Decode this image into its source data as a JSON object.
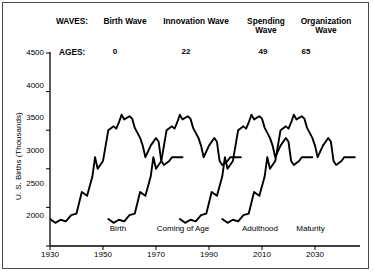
{
  "chart_data": {
    "type": "line",
    "title": "",
    "xlabel": "",
    "ylabel": "U. S. Births (Thousands)",
    "xlim": [
      1930,
      2042
    ],
    "ylim": [
      2000,
      4500
    ],
    "grid": false,
    "legend_position": "none",
    "ytick_labels": [
      "4500",
      "4000",
      "3500",
      "3000",
      "2500",
      "2000"
    ],
    "ytick_values": [
      4500,
      4000,
      3500,
      3000,
      2500,
      2000
    ],
    "xtick_labels": [
      "1930",
      "1950",
      "1970",
      "1990",
      "2010",
      "2030"
    ],
    "xtick_values": [
      1930,
      1950,
      1970,
      1990,
      2010,
      2030
    ],
    "series": [
      {
        "name": "Birth Wave",
        "age_offset": 0,
        "x": [
          1930,
          1932,
          1934,
          1936,
          1938,
          1940,
          1942,
          1944,
          1946,
          1947,
          1948,
          1950,
          1952,
          1954,
          1955,
          1956,
          1957,
          1958,
          1960,
          1961,
          1962,
          1964,
          1965,
          1966,
          1968,
          1970,
          1971,
          1972,
          1973,
          1975,
          1976
        ],
        "values": [
          2350,
          2300,
          2340,
          2320,
          2400,
          2420,
          2700,
          2650,
          2900,
          3150,
          3000,
          3100,
          3500,
          3550,
          3520,
          3600,
          3700,
          3640,
          3680,
          3650,
          3530,
          3400,
          3300,
          3150,
          3300,
          3400,
          3350,
          3100,
          3050,
          3100,
          3150
        ]
      },
      {
        "name": "Innovation Wave",
        "age_offset": 22,
        "x": [
          1952,
          1954,
          1956,
          1958,
          1960,
          1962,
          1964,
          1966,
          1968,
          1969,
          1970,
          1972,
          1974,
          1976,
          1977,
          1978,
          1979,
          1980,
          1982,
          1983,
          1984,
          1986,
          1987,
          1988,
          1990,
          1992,
          1993,
          1994,
          1995,
          1997,
          1998
        ],
        "values": [
          2350,
          2300,
          2340,
          2320,
          2400,
          2420,
          2700,
          2650,
          2900,
          3150,
          3000,
          3100,
          3500,
          3550,
          3520,
          3600,
          3700,
          3640,
          3680,
          3650,
          3530,
          3400,
          3300,
          3150,
          3300,
          3400,
          3350,
          3100,
          3050,
          3100,
          3150
        ]
      },
      {
        "name": "Spending Wave",
        "age_offset": 49,
        "x": [
          1979,
          1981,
          1983,
          1985,
          1987,
          1989,
          1991,
          1993,
          1995,
          1996,
          1997,
          1999,
          2001,
          2003,
          2004,
          2005,
          2006,
          2007,
          2009,
          2010,
          2011,
          2013,
          2014,
          2015,
          2017,
          2019,
          2020,
          2021,
          2022,
          2024,
          2025
        ],
        "values": [
          2350,
          2300,
          2340,
          2320,
          2400,
          2420,
          2700,
          2650,
          2900,
          3150,
          3000,
          3100,
          3500,
          3550,
          3520,
          3600,
          3700,
          3640,
          3680,
          3650,
          3530,
          3400,
          3300,
          3150,
          3300,
          3400,
          3350,
          3100,
          3050,
          3100,
          3150
        ]
      },
      {
        "name": "Organization Wave",
        "age_offset": 65,
        "x": [
          1995,
          1997,
          1999,
          2001,
          2003,
          2005,
          2007,
          2009,
          2011,
          2012,
          2013,
          2015,
          2017,
          2019,
          2020,
          2021,
          2022,
          2023,
          2025,
          2026,
          2027,
          2029,
          2030,
          2031,
          2033,
          2035,
          2036,
          2037,
          2038,
          2040,
          2041
        ],
        "values": [
          2350,
          2300,
          2340,
          2320,
          2400,
          2420,
          2700,
          2650,
          2900,
          3150,
          3000,
          3100,
          3500,
          3550,
          3520,
          3600,
          3700,
          3640,
          3680,
          3650,
          3530,
          3400,
          3300,
          3150,
          3300,
          3400,
          3350,
          3100,
          3050,
          3100,
          3150
        ]
      }
    ],
    "annotations": {
      "waves_key": "WAVES:",
      "ages_key": "AGES:",
      "waves": [
        {
          "label": "Birth Wave",
          "age": "0",
          "stage": "Birth"
        },
        {
          "label": "Innovation Wave",
          "age": "22",
          "stage": "Coming of Age"
        },
        {
          "label": "Spending\nWave",
          "age": "49",
          "stage": "Adulthood"
        },
        {
          "label": "Organization\nWave",
          "age": "65",
          "stage": "Maturity"
        }
      ]
    },
    "colors": {
      "line": "#000000",
      "axis": "#000000",
      "frame": "#4a4a4a",
      "background": "#ffffff"
    }
  }
}
